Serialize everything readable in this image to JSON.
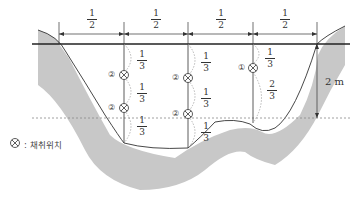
{
  "diagram": {
    "type": "river cross-section sampling positions",
    "top_dimensions": [
      {
        "num": "1",
        "den": "2"
      },
      {
        "num": "1",
        "den": "2"
      },
      {
        "num": "1",
        "den": "2"
      },
      {
        "num": "1",
        "den": "2"
      }
    ],
    "verticals": [
      {
        "segments": [
          {
            "num": "1",
            "den": "3"
          },
          {
            "num": "1",
            "den": "3"
          },
          {
            "num": "1",
            "den": "3"
          }
        ],
        "points": [
          "②",
          "②"
        ]
      },
      {
        "segments": [
          {
            "num": "1",
            "den": "3"
          },
          {
            "num": "1",
            "den": "3"
          },
          {
            "num": "1",
            "den": "3"
          }
        ],
        "points": [
          "②",
          "②"
        ]
      },
      {
        "segments": [
          {
            "num": "1",
            "den": "3"
          },
          {
            "num": "2",
            "den": "3"
          }
        ],
        "points": [
          "①"
        ]
      }
    ],
    "depth_label": "2 m",
    "legend": {
      "symbol": "⊗",
      "text": ": 채취위치"
    },
    "colors": {
      "bed": "#c8c8c8",
      "line": "#333333",
      "dash": "#888888"
    }
  }
}
